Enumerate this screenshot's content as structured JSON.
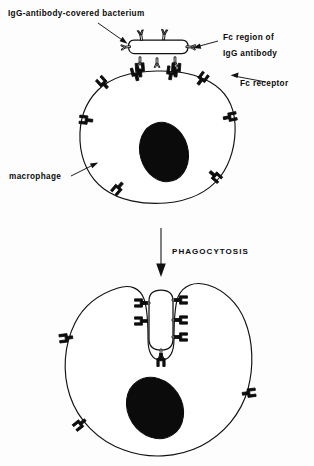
{
  "figure": {
    "background_color": "#fdfdfd",
    "ink_color": "#111111",
    "nucleus_color": "#0b0b0b"
  },
  "labels": {
    "bacterium": "IgG-antibody-covered bacterium",
    "fc_region_line1": "Fc region of",
    "fc_region_line2": "IgG antibody",
    "fc_receptor": "Fc receptor",
    "macrophage": "macrophage",
    "process": "PHAGOCYTOSIS"
  },
  "panels": {
    "top": {
      "name": "binding-stage",
      "cell": "macrophage",
      "target": "IgG-antibody-covered bacterium",
      "receptor_count": 8,
      "antibody_count_free": 4,
      "antibody_count_bound": 3
    },
    "bottom": {
      "name": "engulfment-stage",
      "cell": "macrophage",
      "target": "IgG-antibody-covered bacterium",
      "receptor_count": 3,
      "antibody_count_bound": 5
    }
  },
  "icons": {
    "arrow_down": "downward-arrow",
    "leader_bacterium": "leader-arrow",
    "leader_fc_region": "leader-arrow",
    "leader_fc_receptor": "leader-arrow",
    "leader_macrophage": "leader-arrow"
  }
}
